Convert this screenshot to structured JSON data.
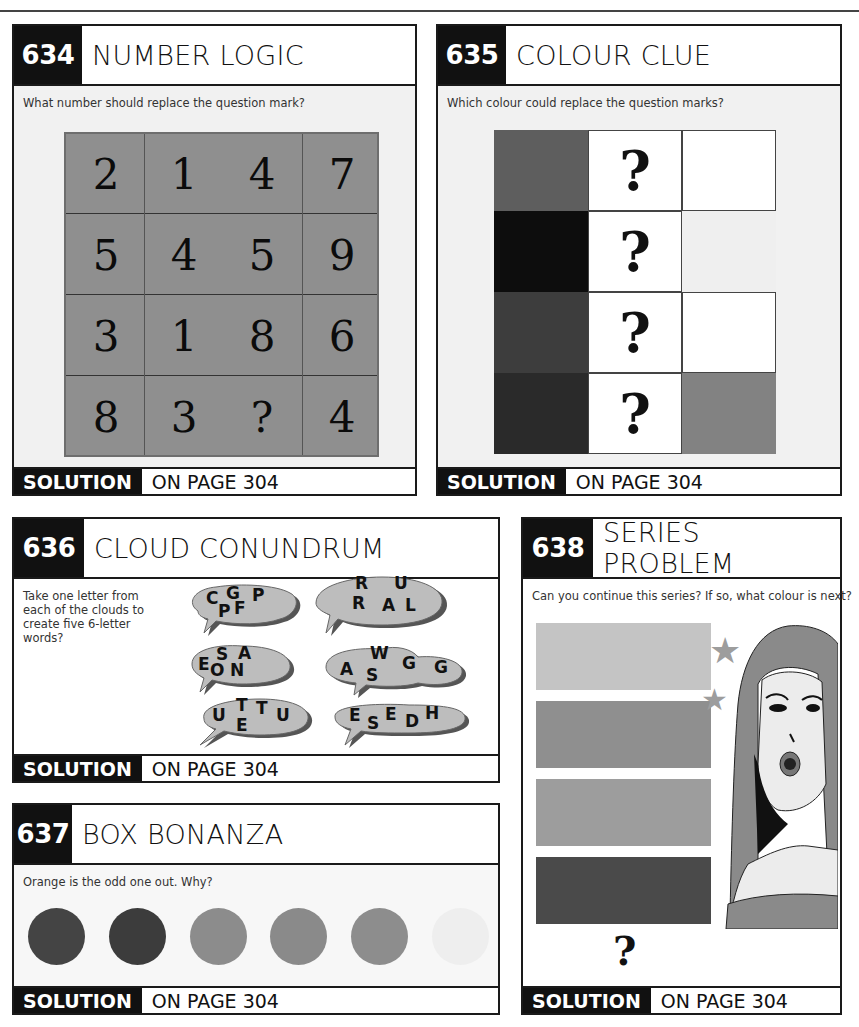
{
  "page": {
    "solution_label": "SOLUTION",
    "solution_page": "ON PAGE 304"
  },
  "puzzles": [
    {
      "number": "634",
      "title": "NUMBER LOGIC",
      "prompt": "What number should replace the question mark?",
      "grid": [
        [
          "2",
          "1",
          "4",
          "7"
        ],
        [
          "5",
          "4",
          "5",
          "9"
        ],
        [
          "3",
          "1",
          "8",
          "6"
        ],
        [
          "8",
          "3",
          "?",
          "4"
        ]
      ],
      "grid_color": "#8f8f8f"
    },
    {
      "number": "635",
      "title": "COLOUR CLUE",
      "prompt": "Which colour could replace the question marks?",
      "rows": [
        {
          "left": "#5e5e5e",
          "middle": "?",
          "right": "#ffffff"
        },
        {
          "left": "#0d0d0d",
          "middle": "?",
          "right": "#efefef"
        },
        {
          "left": "#3d3d3d",
          "middle": "?",
          "right": "#ffffff"
        },
        {
          "left": "#2a2a2a",
          "middle": "?",
          "right": "#828282"
        }
      ]
    },
    {
      "number": "636",
      "title": "CLOUD CONUNDRUM",
      "prompt": "Take one letter from each of the clouds to create five 6-letter words?",
      "clouds": [
        {
          "letters": [
            "C",
            "G",
            "P",
            "P",
            "F"
          ]
        },
        {
          "letters": [
            "R",
            "U",
            "R",
            "A",
            "L"
          ]
        },
        {
          "letters": [
            "E",
            "S",
            "A",
            "O",
            "N"
          ]
        },
        {
          "letters": [
            "A",
            "W",
            "S",
            "G",
            "G"
          ]
        },
        {
          "letters": [
            "U",
            "T",
            "T",
            "U",
            "E"
          ]
        },
        {
          "letters": [
            "E",
            "S",
            "E",
            "D",
            "H"
          ]
        }
      ]
    },
    {
      "number": "637",
      "title": "BOX BONANZA",
      "prompt": "Orange is the odd one out. Why?",
      "circles": [
        "#444444",
        "#3c3c3c",
        "#8c8c8c",
        "#8a8a8a",
        "#8d8d8d",
        "#eeeeee"
      ]
    },
    {
      "number": "638",
      "title": "SERIES PROBLEM",
      "prompt": "Can you continue this series? If so, what colour is next?",
      "bars": [
        "#c4c4c4",
        "#8f8f8f",
        "#9d9d9d",
        "#4a4a4a"
      ],
      "next": "?"
    }
  ]
}
